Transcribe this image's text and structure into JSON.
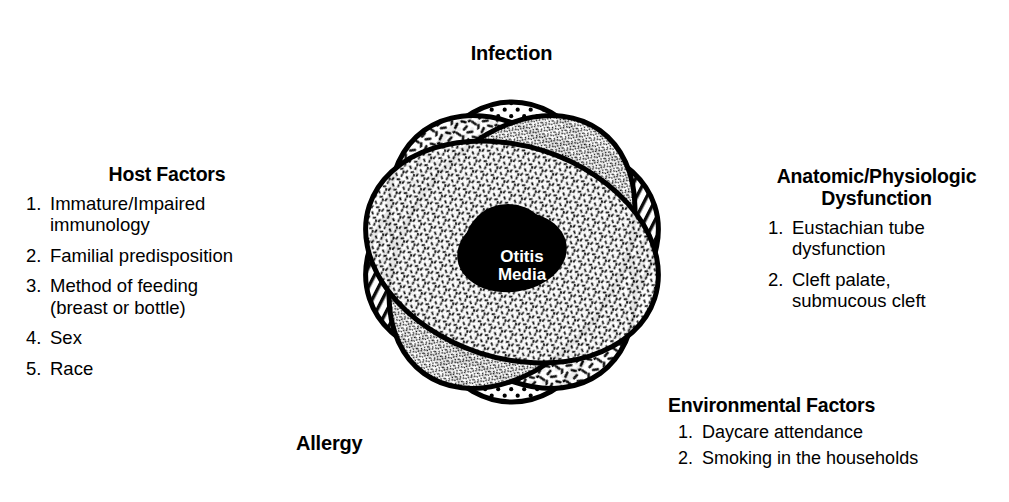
{
  "diagram": {
    "type": "venn-5-set",
    "background_color": "#ffffff",
    "ink_color": "#000000",
    "center": {
      "label": "Otitis\nMedia",
      "fill_color": "#000000",
      "text_color": "#ffffff"
    },
    "sets": [
      {
        "id": "infection",
        "label": "Infection",
        "position": "top",
        "pattern": "dot-grid"
      },
      {
        "id": "anatomic",
        "label": "Anatomic/Physiologic\nDysfunction",
        "position": "right",
        "pattern": "diagonal-hatch"
      },
      {
        "id": "environmental",
        "label": "Environmental Factors",
        "position": "bottom-right",
        "pattern": "coarse-dashes"
      },
      {
        "id": "allergy",
        "label": "Allergy",
        "position": "bottom-left",
        "pattern": "fine-stipple"
      },
      {
        "id": "host",
        "label": "Host Factors",
        "position": "left",
        "pattern": "fine-dashes"
      }
    ]
  },
  "labels": {
    "infection": "Infection",
    "allergy": "Allergy"
  },
  "host_factors": {
    "title": "Host Factors",
    "items": [
      {
        "num": "1.",
        "text": "Immature/Impaired\nimmunology"
      },
      {
        "num": "2.",
        "text": "Familial predisposition"
      },
      {
        "num": "3.",
        "text": "Method of feeding\n(breast or bottle)"
      },
      {
        "num": "4.",
        "text": "Sex"
      },
      {
        "num": "5.",
        "text": "Race"
      }
    ]
  },
  "anatomic": {
    "title": "Anatomic/Physiologic\nDysfunction",
    "items": [
      {
        "num": "1.",
        "text": "Eustachian tube\ndysfunction"
      },
      {
        "num": "2.",
        "text": "Cleft palate,\nsubmucous cleft"
      }
    ]
  },
  "environmental": {
    "title": "Environmental Factors",
    "items": [
      {
        "num": "1.",
        "text": "Daycare attendance"
      },
      {
        "num": "2.",
        "text": "Smoking in the households"
      }
    ]
  }
}
